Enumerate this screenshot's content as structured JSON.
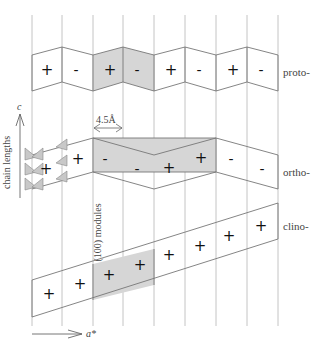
{
  "diagram": {
    "colors": {
      "line": "#777777",
      "grid": "#aaaaaa",
      "shade": "#d6d6d6",
      "text": "#444444"
    },
    "labels": {
      "proto": "proto-",
      "ortho": "ortho-",
      "clino": "clino-",
      "c_axis": "c",
      "a_axis": "a*",
      "chain_lengths": "chain lengths",
      "spacing": "4.5Å",
      "modules": "(100) modules"
    },
    "proto_signs": [
      "+",
      "-",
      "+",
      "-",
      "+",
      "-",
      "+",
      "-"
    ],
    "ortho_signs": [
      "+",
      "+",
      "-",
      "-",
      "+",
      "+",
      "-",
      "-"
    ],
    "clino_signs": [
      "+",
      "+",
      "+",
      "+",
      "+",
      "+",
      "+",
      "+"
    ]
  }
}
